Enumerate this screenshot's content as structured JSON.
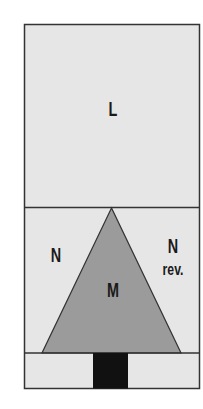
{
  "diagram": {
    "type": "quilt-block-layout",
    "colors": {
      "background": "#e6e6e6",
      "triangle": "#9b9b9b",
      "trunk": "#111111",
      "border": "#333333"
    },
    "regions": [
      {
        "id": "L",
        "label": "L",
        "description": "top rectangle"
      },
      {
        "id": "N",
        "label": "N",
        "description": "left background triangle"
      },
      {
        "id": "M",
        "label": "M",
        "description": "center tree triangle"
      },
      {
        "id": "N-rev",
        "label": "N",
        "sublabel": "rev.",
        "description": "right background triangle (reversed)"
      },
      {
        "id": "trunk",
        "label": "",
        "description": "black trunk rectangle in bottom strip"
      }
    ]
  }
}
